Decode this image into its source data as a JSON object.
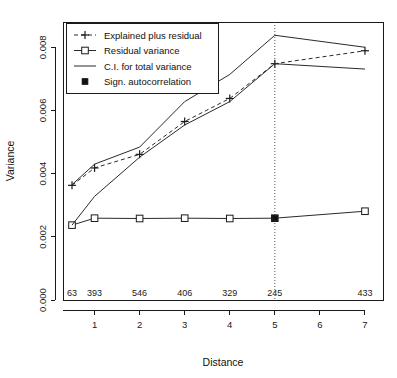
{
  "chart_data": {
    "type": "line",
    "title": "",
    "xlabel": "Distance",
    "ylabel": "Variance",
    "xlim": [
      0.3,
      7.4
    ],
    "ylim": [
      0.0,
      0.0088
    ],
    "grid": false,
    "legend_position": "top-left",
    "x_ticks": [
      1,
      2,
      3,
      4,
      5,
      6,
      7
    ],
    "x_tick_labels": [
      "1",
      "2",
      "3",
      "4",
      "5",
      "6",
      "7"
    ],
    "y_ticks": [
      0.0,
      0.002,
      0.004,
      0.006,
      0.008
    ],
    "y_tick_labels": [
      "0.000",
      "0.002",
      "0.004",
      "0.006",
      "0.008"
    ],
    "count_labels": [
      {
        "x": 0.5,
        "text": "63"
      },
      {
        "x": 1.0,
        "text": "393"
      },
      {
        "x": 2.0,
        "text": "546"
      },
      {
        "x": 3.0,
        "text": "406"
      },
      {
        "x": 4.0,
        "text": "329"
      },
      {
        "x": 5.0,
        "text": "245"
      },
      {
        "x": 7.0,
        "text": "433"
      }
    ],
    "reference_line": {
      "x": 5.0,
      "style": "dotted"
    },
    "series": [
      {
        "name": "Explained plus residual",
        "style": "dashed",
        "marker": "plus",
        "x": [
          0.5,
          1.0,
          2.0,
          3.0,
          4.0,
          5.0,
          7.0
        ],
        "values": [
          0.00363,
          0.00418,
          0.00461,
          0.00565,
          0.00638,
          0.00748,
          0.00789
        ]
      },
      {
        "name": "Residual variance",
        "style": "solid",
        "marker": "square-open",
        "x": [
          0.5,
          1.0,
          2.0,
          3.0,
          4.0,
          5.0,
          7.0
        ],
        "values": [
          0.00237,
          0.00259,
          0.00258,
          0.00259,
          0.00258,
          0.00259,
          0.00281
        ]
      },
      {
        "name": "C.I. for total variance",
        "style": "solid",
        "marker": "none",
        "bound": "upper",
        "x": [
          0.5,
          1.0,
          2.0,
          3.0,
          4.0,
          5.0,
          7.0
        ],
        "values": [
          0.00365,
          0.0043,
          0.00484,
          0.00628,
          0.00714,
          0.00838,
          0.008
        ]
      },
      {
        "name": "C.I. for total variance",
        "style": "solid",
        "marker": "none",
        "bound": "lower",
        "x": [
          0.5,
          1.0,
          2.0,
          3.0,
          4.0,
          5.0,
          7.0
        ],
        "values": [
          0.00237,
          0.00328,
          0.00452,
          0.00554,
          0.00628,
          0.00748,
          0.00731
        ]
      },
      {
        "name": "Sign. autocorrelation",
        "style": "none",
        "marker": "square-filled",
        "x": [
          5.0
        ],
        "values": [
          0.00259
        ]
      }
    ]
  },
  "legend": {
    "entries": [
      {
        "label": "Explained plus residual",
        "key": "dashed-plus"
      },
      {
        "label": "Residual variance",
        "key": "solid-square-open"
      },
      {
        "label": "C.I. for total variance",
        "key": "solid-plain"
      },
      {
        "label": "Sign. autocorrelation",
        "key": "filled-square"
      }
    ]
  },
  "axes": {
    "x_title": "Distance",
    "y_title": "Variance"
  }
}
